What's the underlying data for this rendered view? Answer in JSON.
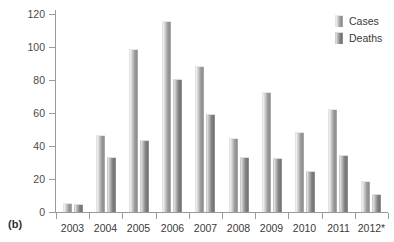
{
  "figure": {
    "panel_label": "(b)"
  },
  "chart_data": {
    "type": "bar",
    "title": "",
    "xlabel": "",
    "ylabel": "",
    "categories": [
      "2003",
      "2004",
      "2005",
      "2006",
      "2007",
      "2008",
      "2009",
      "2010",
      "2011",
      "2012*"
    ],
    "series": [
      {
        "name": "Cases",
        "color": "#c6c6c6",
        "values": [
          5,
          46,
          98,
          115,
          88,
          44,
          72,
          48,
          62,
          18
        ]
      },
      {
        "name": "Deaths",
        "color": "#8f8f8f",
        "values": [
          4,
          33,
          43,
          80,
          59,
          33,
          32,
          24,
          34,
          10
        ]
      }
    ],
    "ylim": [
      0,
      120
    ],
    "yticks": [
      0,
      20,
      40,
      60,
      80,
      100,
      120
    ],
    "ytick_labels": [
      "0",
      "20",
      "40",
      "60",
      "80",
      "100",
      "120"
    ],
    "grid": false,
    "legend_position": "top-right",
    "axis_color": "#9a9a9a",
    "footnote_marker": "*"
  },
  "legend": {
    "items": [
      {
        "label": "Cases"
      },
      {
        "label": "Deaths"
      }
    ]
  }
}
